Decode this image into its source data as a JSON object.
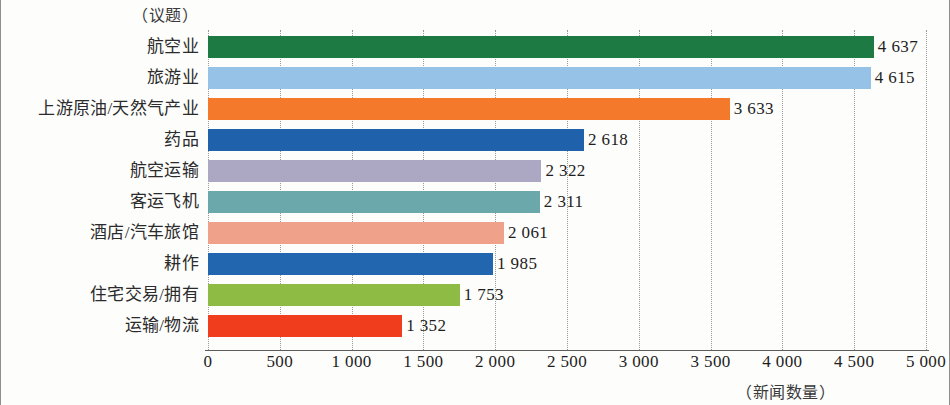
{
  "chart_data": {
    "type": "bar",
    "orientation": "horizontal",
    "title": "",
    "xlabel": "（新闻数量）",
    "ylabel": "（议题）",
    "xlim": [
      0,
      5000
    ],
    "grid": true,
    "legend": "none",
    "xticks": [
      "0",
      "500",
      "1 000",
      "1 500",
      "2 000",
      "2 500",
      "3 000",
      "3 500",
      "4 000",
      "4 500",
      "5 000"
    ],
    "xtick_values": [
      0,
      500,
      1000,
      1500,
      2000,
      2500,
      3000,
      3500,
      4000,
      4500,
      5000
    ],
    "categories": [
      "航空业",
      "旅游业",
      "上游原油/天然气产业",
      "药品",
      "航空运输",
      "客运飞机",
      "酒店/汽车旅馆",
      "耕作",
      "住宅交易/拥有",
      "运输/物流"
    ],
    "values": [
      4637,
      4615,
      3633,
      2618,
      2322,
      2311,
      2061,
      1985,
      1753,
      1352
    ],
    "value_labels": [
      "4 637",
      "4 615",
      "3 633",
      "2 618",
      "2 322",
      "2 311",
      "2 061",
      "1 985",
      "1 753",
      "1 352"
    ],
    "colors": [
      "#1d7a43",
      "#95c2e6",
      "#f4792a",
      "#1f62ab",
      "#aca7c2",
      "#6ba8ab",
      "#f0a189",
      "#2366b0",
      "#8dbb43",
      "#ef3d1e"
    ]
  }
}
